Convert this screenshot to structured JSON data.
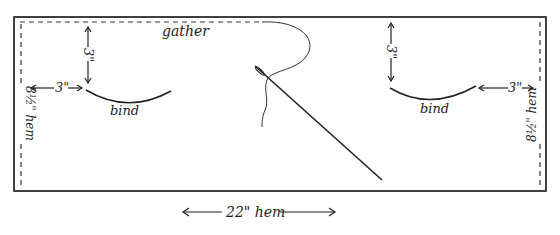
{
  "diagram": {
    "labels": {
      "gather": "gather",
      "top_left_vertical": "3\"",
      "top_left_horizontal": "3\"",
      "bind_left": "bind",
      "top_right_vertical": "3\"",
      "top_right_horizontal": "3\"",
      "bind_right": "bind",
      "left_hem": "8½\" hem",
      "right_hem": "8½\" hem",
      "bottom_hem": "22\" hem"
    },
    "colors": {
      "line": "#333333",
      "background": "#ffffff"
    }
  }
}
